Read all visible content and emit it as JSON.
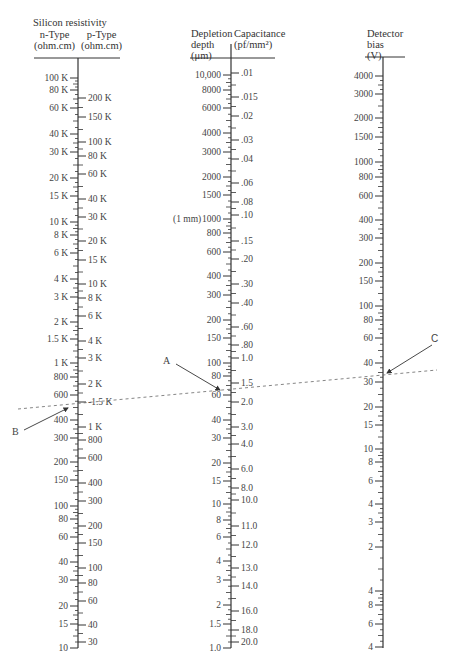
{
  "figure": {
    "type": "nomogram",
    "dashed_line": {
      "from": [
        18,
        409
      ],
      "to": [
        437,
        370
      ]
    },
    "annotations": [
      {
        "id": "A",
        "label": "A",
        "label_pos": [
          167,
          361
        ],
        "arrow_from": [
          176,
          364
        ],
        "arrow_to": [
          220,
          390
        ]
      },
      {
        "id": "B",
        "label": "B",
        "label_pos": [
          16,
          432
        ],
        "arrow_from": [
          24,
          430
        ],
        "arrow_to": [
          68,
          408
        ]
      },
      {
        "id": "C",
        "label": "C",
        "label_pos": [
          435,
          339
        ],
        "arrow_from": [
          432,
          345
        ],
        "arrow_to": [
          387,
          373
        ]
      }
    ]
  },
  "axes": {
    "resistivity": {
      "x": 78,
      "title": "Silicon resistivity",
      "left_header": [
        "n-Type",
        "(ohm.cm)"
      ],
      "right_header": [
        "p-Type",
        "(ohm.cm)"
      ],
      "rule_y": 58,
      "top": 58,
      "bottom": 648,
      "left_ticks": [
        {
          "label": "100 K",
          "y": 78
        },
        {
          "label": "80 K",
          "y": 90
        },
        {
          "label": "60 K",
          "y": 108
        },
        {
          "label": "40 K",
          "y": 134
        },
        {
          "label": "30 K",
          "y": 152
        },
        {
          "label": "20 K",
          "y": 178
        },
        {
          "label": "15 K",
          "y": 196
        },
        {
          "label": "10 K",
          "y": 222
        },
        {
          "label": "8 K",
          "y": 235
        },
        {
          "label": "6 K",
          "y": 253
        },
        {
          "label": "4 K",
          "y": 279
        },
        {
          "label": "3 K",
          "y": 297
        },
        {
          "label": "2 K",
          "y": 322
        },
        {
          "label": "1.5 K",
          "y": 339
        },
        {
          "label": "1 K",
          "y": 363
        },
        {
          "label": "800",
          "y": 377
        },
        {
          "label": "600",
          "y": 395
        },
        {
          "label": "400",
          "y": 420
        },
        {
          "label": "300",
          "y": 438
        },
        {
          "label": "200",
          "y": 462
        },
        {
          "label": "150",
          "y": 480
        },
        {
          "label": "100",
          "y": 506
        },
        {
          "label": "80",
          "y": 519
        },
        {
          "label": "60",
          "y": 537
        },
        {
          "label": "40",
          "y": 562
        },
        {
          "label": "30",
          "y": 580
        },
        {
          "label": "20",
          "y": 606
        },
        {
          "label": "15",
          "y": 624
        },
        {
          "label": "10",
          "y": 648
        }
      ],
      "right_ticks": [
        {
          "label": "200 K",
          "y": 98
        },
        {
          "label": "150 K",
          "y": 117
        },
        {
          "label": "100 K",
          "y": 142
        },
        {
          "label": "80 K",
          "y": 156
        },
        {
          "label": "60 K",
          "y": 174
        },
        {
          "label": "40 K",
          "y": 199
        },
        {
          "label": "30 K",
          "y": 217
        },
        {
          "label": "20 K",
          "y": 241
        },
        {
          "label": "15 K",
          "y": 260
        },
        {
          "label": "10 K",
          "y": 284
        },
        {
          "label": "8 K",
          "y": 298
        },
        {
          "label": "6 K",
          "y": 316
        },
        {
          "label": "4 K",
          "y": 341
        },
        {
          "label": "3 K",
          "y": 358
        },
        {
          "label": "2 K",
          "y": 384
        },
        {
          "label": "-1.5 K",
          "y": 402
        },
        {
          "label": "1 K",
          "y": 427
        },
        {
          "label": "800",
          "y": 440
        },
        {
          "label": "600",
          "y": 458
        },
        {
          "label": "400",
          "y": 483
        },
        {
          "label": "300",
          "y": 501
        },
        {
          "label": "200",
          "y": 526
        },
        {
          "label": "150",
          "y": 543
        },
        {
          "label": "100",
          "y": 568
        },
        {
          "label": "80",
          "y": 583
        },
        {
          "label": "60",
          "y": 601
        },
        {
          "label": "40",
          "y": 625
        },
        {
          "label": "30",
          "y": 642
        }
      ]
    },
    "depletion": {
      "x": 231,
      "left_header": [
        "Depletion",
        "depth",
        "(μm)"
      ],
      "right_header": [
        "Capacitance",
        "(pf/mm²)"
      ],
      "rule_y": 58,
      "top": 44,
      "bottom": 648,
      "mm_note": {
        "label": "(1 mm)",
        "y": 219
      },
      "left_ticks": [
        {
          "label": "10,000",
          "y": 75
        },
        {
          "label": "8000",
          "y": 90
        },
        {
          "label": "6000",
          "y": 108
        },
        {
          "label": "4000",
          "y": 133
        },
        {
          "label": "3000",
          "y": 152
        },
        {
          "label": "2000",
          "y": 177
        },
        {
          "label": "1500",
          "y": 195
        },
        {
          "label": "1000",
          "y": 219
        },
        {
          "label": "800",
          "y": 233
        },
        {
          "label": "600",
          "y": 252
        },
        {
          "label": "400",
          "y": 276
        },
        {
          "label": "300",
          "y": 295
        },
        {
          "label": "200",
          "y": 320
        },
        {
          "label": "150",
          "y": 338
        },
        {
          "label": "100",
          "y": 363
        },
        {
          "label": "80",
          "y": 376
        },
        {
          "label": "60",
          "y": 395
        },
        {
          "label": "40",
          "y": 420
        },
        {
          "label": "30",
          "y": 438
        },
        {
          "label": "20",
          "y": 463
        },
        {
          "label": "15",
          "y": 481
        },
        {
          "label": "10",
          "y": 504
        },
        {
          "label": "8",
          "y": 520
        },
        {
          "label": "6",
          "y": 537
        },
        {
          "label": "4",
          "y": 561
        },
        {
          "label": "3",
          "y": 580
        },
        {
          "label": "2",
          "y": 605
        },
        {
          "label": "1.5",
          "y": 624
        },
        {
          "label": "1.0",
          "y": 648
        }
      ],
      "right_ticks": [
        {
          "label": ".01",
          "y": 73
        },
        {
          "label": ".015",
          "y": 97
        },
        {
          "label": ".02",
          "y": 116
        },
        {
          "label": ".03",
          "y": 140
        },
        {
          "label": ".04",
          "y": 159
        },
        {
          "label": ".06",
          "y": 183
        },
        {
          "label": ".08",
          "y": 202
        },
        {
          "label": ".10",
          "y": 215
        },
        {
          "label": ".15",
          "y": 241
        },
        {
          "label": ".20",
          "y": 259
        },
        {
          "label": ".30",
          "y": 284
        },
        {
          "label": ".40",
          "y": 303
        },
        {
          "label": ".60",
          "y": 327
        },
        {
          "label": ".80",
          "y": 345
        },
        {
          "label": "1.0",
          "y": 358
        },
        {
          "label": "1.5",
          "y": 383
        },
        {
          "label": "2.0",
          "y": 402
        },
        {
          "label": "3.0",
          "y": 427
        },
        {
          "label": "4.0",
          "y": 444
        },
        {
          "label": "6.0",
          "y": 469
        },
        {
          "label": "8.0",
          "y": 488
        },
        {
          "label": "10.0",
          "y": 500
        },
        {
          "label": "11.0",
          "y": 526
        },
        {
          "label": "12.0",
          "y": 545
        },
        {
          "label": "13.0",
          "y": 568
        },
        {
          "label": "14.0",
          "y": 586
        },
        {
          "label": "16.0",
          "y": 611
        },
        {
          "label": "18.0",
          "y": 630
        },
        {
          "label": "20.0",
          "y": 642
        }
      ]
    },
    "bias": {
      "x": 383,
      "left_header": [
        "Detector",
        "bias",
        "(V)"
      ],
      "rule_y": 57,
      "top": 57,
      "bottom": 648,
      "left_ticks": [
        {
          "label": "4000",
          "y": 76
        },
        {
          "label": "3000",
          "y": 94
        },
        {
          "label": "2000",
          "y": 118
        },
        {
          "label": "1500",
          "y": 137
        },
        {
          "label": "1000",
          "y": 162
        },
        {
          "label": "800",
          "y": 177
        },
        {
          "label": "600",
          "y": 196
        },
        {
          "label": "400",
          "y": 220
        },
        {
          "label": "300",
          "y": 238
        },
        {
          "label": "200",
          "y": 263
        },
        {
          "label": "150",
          "y": 281
        },
        {
          "label": "100",
          "y": 306
        },
        {
          "label": "80",
          "y": 320
        },
        {
          "label": "60",
          "y": 338
        },
        {
          "label": "40",
          "y": 363
        },
        {
          "label": "30",
          "y": 382
        },
        {
          "label": "20",
          "y": 407
        },
        {
          "label": "15",
          "y": 425
        },
        {
          "label": "10",
          "y": 449
        },
        {
          "label": "8",
          "y": 462
        },
        {
          "label": "6",
          "y": 481
        },
        {
          "label": "4",
          "y": 504
        },
        {
          "label": "3",
          "y": 522
        },
        {
          "label": "2",
          "y": 547
        },
        {
          "label": "4",
          "y": 591
        },
        {
          "label": "8",
          "y": 605
        },
        {
          "label": "6",
          "y": 624
        },
        {
          "label": "4",
          "y": 647
        }
      ]
    }
  },
  "colors": {
    "ink": "#333333",
    "label": "#444444",
    "dashed": "#666666"
  }
}
